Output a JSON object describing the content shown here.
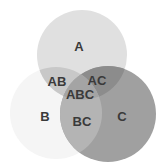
{
  "diagram": {
    "type": "venn",
    "sets": [
      {
        "id": "A",
        "label": "A",
        "cx": 82,
        "cy": 55,
        "r": 45,
        "color": "#e0e0e0"
      },
      {
        "id": "B",
        "label": "B",
        "cx": 56,
        "cy": 113,
        "r": 46,
        "color": "#f5f5f5"
      },
      {
        "id": "C",
        "label": "C",
        "cx": 108,
        "cy": 114,
        "r": 48,
        "color": "#a0a0a0"
      }
    ],
    "regions": {
      "A": {
        "label": "A",
        "x": 79,
        "y": 46,
        "color": "#e0e0e0"
      },
      "B": {
        "label": "B",
        "x": 45,
        "y": 116,
        "color": "#f5f5f5"
      },
      "C": {
        "label": "C",
        "x": 122,
        "y": 116,
        "color": "#a0a0a0"
      },
      "AB": {
        "label": "AB",
        "x": 57,
        "y": 81,
        "color": "#c8c8c8"
      },
      "AC": {
        "label": "AC",
        "x": 97,
        "y": 80,
        "color": "#8c8c8c"
      },
      "BC": {
        "label": "BC",
        "x": 82,
        "y": 121,
        "color": "#b4b4b4"
      },
      "ABC": {
        "label": "ABC",
        "x": 80,
        "y": 94,
        "color": "#a4a4a4"
      }
    },
    "label_color": "#3a3a3a"
  }
}
